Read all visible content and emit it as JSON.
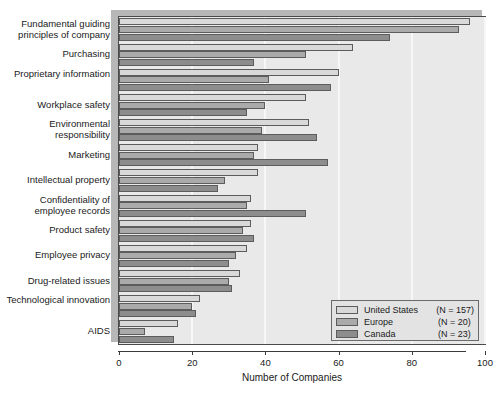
{
  "chart_data": {
    "type": "bar",
    "orientation": "horizontal",
    "title": "",
    "xlabel": "Number of Companies",
    "ylabel": "",
    "xlim": [
      0,
      100
    ],
    "xticks": [
      0,
      20,
      40,
      60,
      80,
      100
    ],
    "grid": "vertical",
    "legend_position": "bottom-right",
    "categories": [
      "Fundamental guiding principles of company",
      "Purchasing",
      "Proprietary information",
      "Workplace safety",
      "Environmental responsibility",
      "Marketing",
      "Intellectual property",
      "Confidentiality of employee records",
      "Product safety",
      "Employee privacy",
      "Drug-related issues",
      "Technological innovation",
      "AIDS"
    ],
    "series": [
      {
        "name": "United States",
        "n_label": "(N = 157)",
        "color": "#d9d9d9",
        "values": [
          96,
          64,
          60,
          51,
          52,
          38,
          38,
          36,
          36,
          35,
          33,
          22,
          16
        ]
      },
      {
        "name": "Europe",
        "n_label": "(N = 20)",
        "color": "#aaaaaa",
        "values": [
          93,
          51,
          41,
          40,
          39,
          37,
          29,
          35,
          34,
          32,
          30,
          20,
          7
        ]
      },
      {
        "name": "Canada",
        "n_label": "(N = 23)",
        "color": "#8d8d8d",
        "values": [
          74,
          37,
          58,
          35,
          54,
          57,
          27,
          51,
          37,
          30,
          31,
          21,
          15
        ]
      }
    ]
  },
  "legend": {
    "entries": [
      {
        "label": "United States",
        "n": "(N = 157)"
      },
      {
        "label": "Europe",
        "n": "(N = 20)"
      },
      {
        "label": "Canada",
        "n": "(N = 23)"
      }
    ]
  },
  "axis": {
    "x_title": "Number of Companies",
    "x_ticks": [
      "0",
      "20",
      "40",
      "60",
      "80",
      "100"
    ]
  }
}
